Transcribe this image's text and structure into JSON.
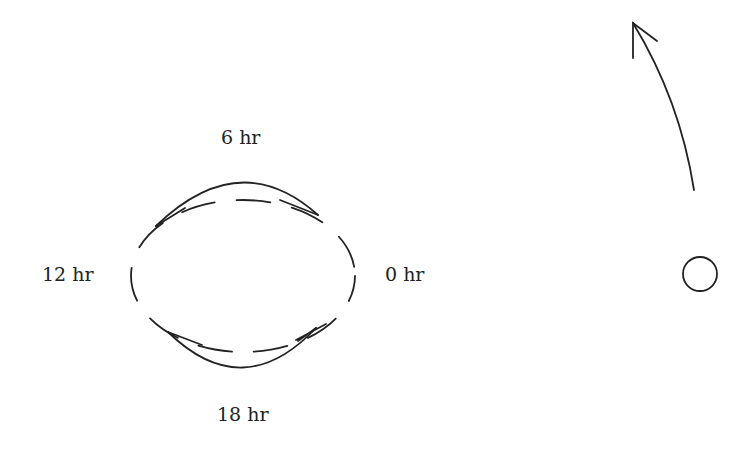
{
  "diagram": {
    "labels": {
      "top": "6 hr",
      "left": "12 hr",
      "right": "0 hr",
      "bottom": "18 hr"
    },
    "elements": {
      "orbit": "dashed-ellipse",
      "top_arc": "solid-arc-with-arrows",
      "bottom_arc": "solid-arc-with-arrows",
      "direction_arrow": "curved-arrow-up",
      "body": "small-circle"
    },
    "colors": {
      "stroke": "#222222",
      "background": "#ffffff"
    }
  }
}
